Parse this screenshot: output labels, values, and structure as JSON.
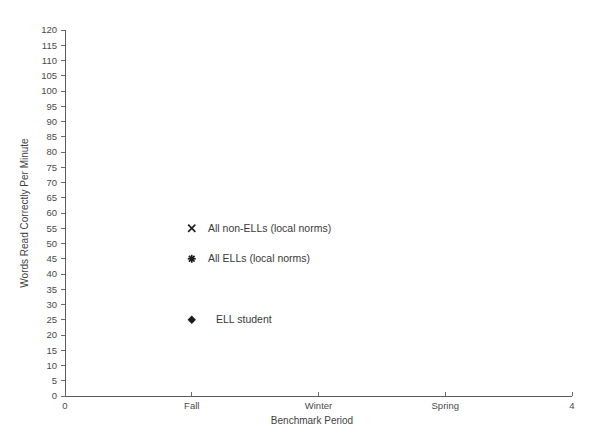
{
  "chart_data": {
    "type": "scatter",
    "title": "",
    "xlabel": "Benchmark Period",
    "ylabel": "Words Read Correctly Per Minute",
    "grid": false,
    "legend_position": "inside-plot",
    "xlim": [
      0,
      4
    ],
    "ylim": [
      0,
      120
    ],
    "x_tick_values": [
      0,
      1,
      2,
      3,
      4
    ],
    "x_tick_labels": [
      "0",
      "Fall",
      "Winter",
      "Spring",
      "4"
    ],
    "y_tick_values": [
      0,
      5,
      10,
      15,
      20,
      25,
      30,
      35,
      40,
      45,
      50,
      55,
      60,
      65,
      70,
      75,
      80,
      85,
      90,
      95,
      100,
      105,
      110,
      115,
      120
    ],
    "y_tick_labels": [
      "0",
      "5",
      "10",
      "15",
      "20",
      "25",
      "30",
      "35",
      "40",
      "45",
      "50",
      "55",
      "60",
      "65",
      "70",
      "75",
      "80",
      "85",
      "90",
      "95",
      "100",
      "105",
      "110",
      "115",
      "120"
    ],
    "series": [
      {
        "name": "All non-ELLs (local norms)",
        "marker": "cross",
        "color": "#1c1c1c",
        "points": [
          {
            "x": 1,
            "y": 55
          }
        ]
      },
      {
        "name": "All ELLs (local norms)",
        "marker": "asterisk",
        "color": "#1c1c1c",
        "points": [
          {
            "x": 1,
            "y": 45
          }
        ]
      },
      {
        "name": "ELL student",
        "marker": "diamond",
        "color": "#1c1c1c",
        "points": [
          {
            "x": 1,
            "y": 25
          }
        ]
      }
    ],
    "legend_entries": [
      {
        "label": "All non-ELLs (local norms)",
        "marker": "cross",
        "x": 1,
        "y": 55
      },
      {
        "label": "All ELLs (local norms)",
        "marker": "asterisk",
        "x": 1,
        "y": 45
      },
      {
        "label": "ELL student",
        "marker": "diamond",
        "x": 1,
        "y": 25
      }
    ]
  }
}
